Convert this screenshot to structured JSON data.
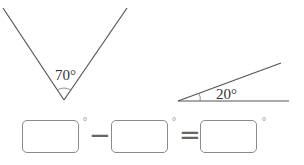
{
  "figures": {
    "v_angle": {
      "label": "70°",
      "value_degrees": 70
    },
    "small_angle": {
      "label": "20°",
      "value_degrees": 20
    }
  },
  "equation": {
    "blanks": [
      "",
      "",
      ""
    ],
    "unit": "°",
    "operators": [
      "−",
      "="
    ]
  },
  "colors": {
    "line": "#555555",
    "box_border": "#8a8a8a"
  }
}
